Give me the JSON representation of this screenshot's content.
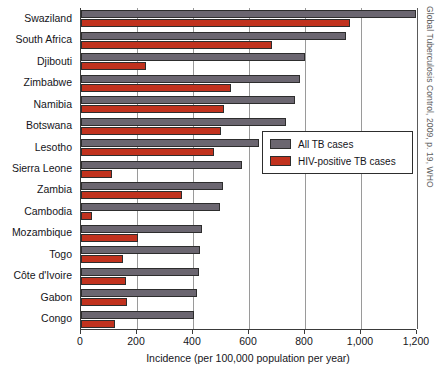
{
  "chart_data": {
    "type": "bar",
    "orientation": "horizontal",
    "title": "",
    "xlabel": "Incidence (per 100,000 population per year)",
    "ylabel": "",
    "xlim": [
      0,
      1200
    ],
    "xticks": [
      0,
      200,
      400,
      600,
      800,
      1000,
      1200
    ],
    "xtick_labels": [
      "0",
      "200",
      "400",
      "600",
      "800",
      "1,000",
      "1,200"
    ],
    "grid": true,
    "legend_position": "center-right",
    "categories": [
      "Swaziland",
      "South Africa",
      "Djibouti",
      "Zimbabwe",
      "Namibia",
      "Botswana",
      "Lesotho",
      "Sierra Leone",
      "Zambia",
      "Cambodia",
      "Mozambique",
      "Togo",
      "Côte d'Ivoire",
      "Gabon",
      "Congo"
    ],
    "series": [
      {
        "name": "All TB cases",
        "color": "#6b6670",
        "values": [
          1198,
          948,
          801,
          782,
          765,
          731,
          637,
          574,
          506,
          495,
          431,
          425,
          420,
          413,
          403
        ]
      },
      {
        "name": "HIV-positive TB cases",
        "color": "#c1321e",
        "values": [
          960,
          681,
          231,
          534,
          512,
          500,
          476,
          112,
          360,
          40,
          205,
          150,
          160,
          166,
          120
        ]
      }
    ]
  },
  "legend": {
    "items": [
      {
        "label": "All TB cases",
        "color": "#6b6670"
      },
      {
        "label": "HIV-positive TB cases",
        "color": "#c1321e"
      }
    ]
  },
  "axis": {
    "x_title": "Incidence (per 100,000 population per year)"
  },
  "source_credit": "Global Tuberculosis Control, 2009, p. 19, WHO"
}
